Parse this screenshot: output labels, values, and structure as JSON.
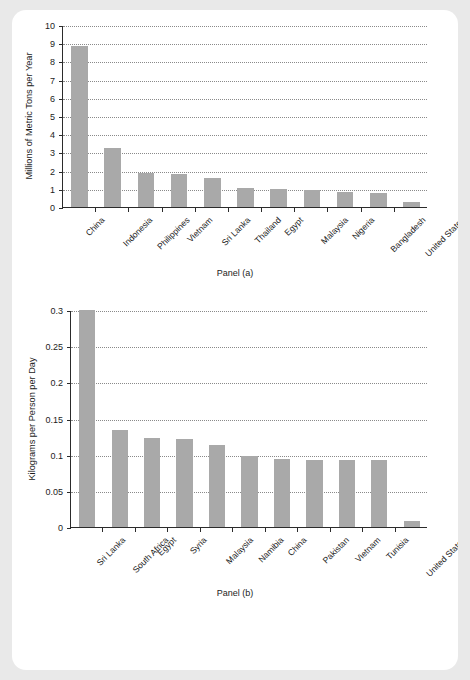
{
  "figure": {
    "background_color": "#e9e9e9",
    "card_color": "#ffffff",
    "bar_color": "#a9a9a9",
    "axis_color": "#2b2b2b",
    "grid_color": "#8a8a8a"
  },
  "panel_a": {
    "caption": "Panel (a)",
    "ylabel": "Millions of Metric Tons per Year",
    "ytick_labels": [
      "0",
      "1",
      "2",
      "3",
      "4",
      "5",
      "6",
      "7",
      "8",
      "9",
      "10"
    ]
  },
  "panel_b": {
    "caption": "Panel (b)",
    "ylabel": "Kilograms per Person per Day",
    "ytick_labels": [
      "0",
      "0.05",
      "0.1",
      "0.15",
      "0.2",
      "0.25",
      "0.3"
    ]
  },
  "chart_data": [
    {
      "type": "bar",
      "title": "Panel (a)",
      "xlabel": "",
      "ylabel": "Millions of Metric Tons per Year",
      "ylim": [
        0,
        10
      ],
      "yticks": [
        0,
        1,
        2,
        3,
        4,
        5,
        6,
        7,
        8,
        9,
        10
      ],
      "grid": true,
      "legend": "none",
      "categories": [
        "China",
        "Indonesia",
        "Philippines",
        "Vietnam",
        "Sri Lanka",
        "Thailand",
        "Egypt",
        "Malaysia",
        "Nigeria",
        "Bangladesh",
        "United States"
      ],
      "values": [
        8.82,
        3.22,
        1.88,
        1.83,
        1.59,
        1.03,
        0.97,
        0.94,
        0.85,
        0.79,
        0.28
      ]
    },
    {
      "type": "bar",
      "title": "Panel (b)",
      "xlabel": "",
      "ylabel": "Kilograms per Person per Day",
      "ylim": [
        0,
        0.3
      ],
      "yticks": [
        0,
        0.05,
        0.1,
        0.15,
        0.2,
        0.25,
        0.3
      ],
      "grid": true,
      "legend": "none",
      "categories": [
        "Sri Lanka",
        "South Africa",
        "Egypt",
        "Syria",
        "Malaysia",
        "Namibia",
        "China",
        "Pakistan",
        "Vietnam",
        "Tunisia",
        "United States"
      ],
      "values": [
        0.3,
        0.134,
        0.123,
        0.121,
        0.113,
        0.098,
        0.094,
        0.093,
        0.093,
        0.092,
        0.008
      ]
    }
  ]
}
